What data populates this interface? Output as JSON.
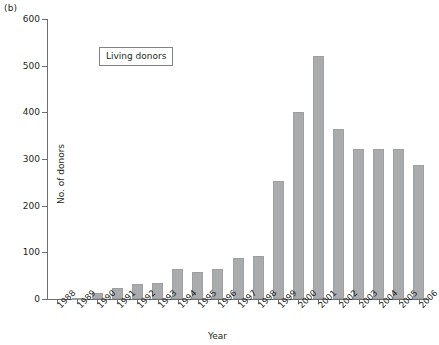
{
  "panel_label": "(b)",
  "legend": {
    "text": "Living donors"
  },
  "chart_data": {
    "type": "bar",
    "title": "",
    "xlabel": "Year",
    "ylabel": "No. of donors",
    "categories": [
      "1988",
      "1989",
      "1990",
      "1991",
      "1992",
      "1993",
      "1994",
      "1995",
      "1996",
      "1997",
      "1998",
      "1999",
      "2000",
      "2001",
      "2002",
      "2003",
      "2004",
      "2005",
      "2006"
    ],
    "values": [
      0,
      1,
      13,
      23,
      33,
      35,
      65,
      58,
      65,
      88,
      92,
      252,
      400,
      520,
      365,
      322,
      322,
      322,
      287
    ],
    "series": [
      {
        "name": "Living donors",
        "values": [
          0,
          1,
          13,
          23,
          33,
          35,
          65,
          58,
          65,
          88,
          92,
          252,
          400,
          520,
          365,
          322,
          322,
          322,
          287
        ]
      }
    ],
    "ylim": [
      0,
      600
    ],
    "yticks": [
      0,
      100,
      200,
      300,
      400,
      500,
      600
    ],
    "ytick_labels": [
      "0",
      "100",
      "200",
      "300",
      "400",
      "500",
      "600"
    ],
    "grid": false,
    "legend_position": "top-left",
    "bar_color": "#aaabad",
    "axis_color": "#6d6e71"
  }
}
